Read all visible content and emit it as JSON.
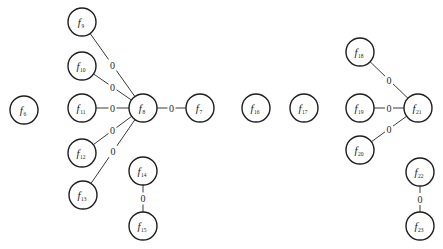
{
  "diagram": {
    "type": "graph",
    "node_radius": 14,
    "colors": {
      "node_stroke": "#1e1e1e",
      "node_fill": "#ffffff",
      "edge_stroke": "#3a3a3a",
      "text": "#1e1e1e",
      "background": "#ffffff"
    },
    "nodes": [
      {
        "id": "f6",
        "base": "f",
        "sub": "6",
        "x": 24,
        "y": 110
      },
      {
        "id": "f7",
        "base": "f",
        "sub": "7",
        "x": 200,
        "y": 108
      },
      {
        "id": "f8",
        "base": "f",
        "sub": "8",
        "x": 143,
        "y": 108
      },
      {
        "id": "f9",
        "base": "f",
        "sub": "9",
        "x": 82,
        "y": 22
      },
      {
        "id": "f10",
        "base": "f",
        "sub": "10",
        "x": 82,
        "y": 66
      },
      {
        "id": "f11",
        "base": "f",
        "sub": "11",
        "x": 82,
        "y": 108
      },
      {
        "id": "f12",
        "base": "f",
        "sub": "12",
        "x": 82,
        "y": 153
      },
      {
        "id": "f13",
        "base": "f",
        "sub": "13",
        "x": 83,
        "y": 195
      },
      {
        "id": "f14",
        "base": "f",
        "sub": "14",
        "x": 143,
        "y": 171
      },
      {
        "id": "f15",
        "base": "f",
        "sub": "15",
        "x": 143,
        "y": 226
      },
      {
        "id": "f16",
        "base": "f",
        "sub": "16",
        "x": 256,
        "y": 108
      },
      {
        "id": "f17",
        "base": "f",
        "sub": "17",
        "x": 304,
        "y": 108
      },
      {
        "id": "f18",
        "base": "f",
        "sub": "18",
        "x": 360,
        "y": 52
      },
      {
        "id": "f19",
        "base": "f",
        "sub": "19",
        "x": 360,
        "y": 108
      },
      {
        "id": "f20",
        "base": "f",
        "sub": "20",
        "x": 360,
        "y": 150
      },
      {
        "id": "f21",
        "base": "f",
        "sub": "21",
        "x": 418,
        "y": 108
      },
      {
        "id": "f22",
        "base": "f",
        "sub": "22",
        "x": 420,
        "y": 172
      },
      {
        "id": "f23",
        "base": "f",
        "sub": "23",
        "x": 420,
        "y": 226
      }
    ],
    "edges": [
      {
        "from": "f9",
        "to": "f8",
        "weight": "0"
      },
      {
        "from": "f10",
        "to": "f8",
        "weight": "0"
      },
      {
        "from": "f11",
        "to": "f8",
        "weight": "0"
      },
      {
        "from": "f8",
        "to": "f7",
        "weight": "0"
      },
      {
        "from": "f12",
        "to": "f8",
        "weight": "0"
      },
      {
        "from": "f13",
        "to": "f8",
        "weight": "0"
      },
      {
        "from": "f14",
        "to": "f15",
        "weight": "0"
      },
      {
        "from": "f18",
        "to": "f21",
        "weight": "0"
      },
      {
        "from": "f19",
        "to": "f21",
        "weight": "0"
      },
      {
        "from": "f20",
        "to": "f21",
        "weight": "0"
      },
      {
        "from": "f22",
        "to": "f23",
        "weight": "0"
      }
    ]
  }
}
